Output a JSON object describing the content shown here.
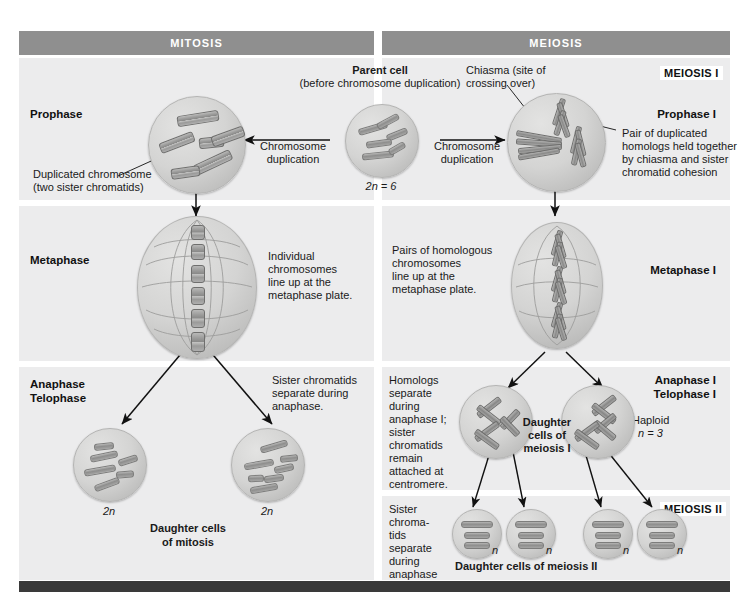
{
  "figure": {
    "title_bars": {
      "mitosis": "MITOSIS",
      "meiosis": "MEIOSIS"
    },
    "section_tags": {
      "meiosis_i": "MEIOSIS I",
      "meiosis_ii": "MEIOSIS II"
    },
    "mitosis_column": {
      "phase_labels": {
        "prophase": "Prophase",
        "metaphase": "Metaphase",
        "anaphase": "Anaphase",
        "telophase": "Telophase"
      },
      "annotations": {
        "duplicated_chromosome_line1": "Duplicated chromosome",
        "duplicated_chromosome_line2": "(two sister chromatids)",
        "chromosome_duplication": "Chromosome\nduplication",
        "individual_chromosomes": "Individual\nchromosomes\nline up at the\nmetaphase plate.",
        "sister_chromatids_separate": "Sister chromatids\nseparate during\nanaphase."
      },
      "ploidy_left": "2n",
      "ploidy_right": "2n",
      "daughter_cells_caption": "Daughter cells\nof mitosis"
    },
    "parent_cell": {
      "title": "Parent cell",
      "subtitle": "(before chromosome duplication)",
      "ploidy": "2n = 6",
      "duplication_label": "Chromosome\nduplication"
    },
    "meiosis_column": {
      "phase_labels": {
        "prophase_i": "Prophase I",
        "metaphase_i": "Metaphase I",
        "anaphase_i": "Anaphase I",
        "telophase_i": "Telophase I"
      },
      "annotations": {
        "chiasma": "Chiasma (site of\ncrossing over)",
        "pair_of_homologs": "Pair of duplicated\nhomologs held together\nby chiasma and sister\nchromatid cohesion",
        "pairs_of_homologous": "Pairs of homologous\nchromosomes\nline up at the\nmetaphase plate.",
        "homologs_separate": "Homologs\nseparate\nduring\nanaphase I;\nsister\nchromatids\nremain\nattached at\ncentromere.",
        "haploid": "Haploid",
        "haploid_n": "n = 3",
        "daughter_cells_meiosis_i": "Daughter\ncells of\nmeiosis I",
        "sister_chromatids_separate_ii": "Sister\nchroma-\ntids\nseparate\nduring\nanaphase II.",
        "daughter_cells_meiosis_ii": "Daughter cells of meiosis II"
      },
      "ploidy_meiosis_ii": [
        "n",
        "n",
        "n",
        "n"
      ]
    },
    "colors": {
      "header_bar": "#8f8f8f",
      "panel_bg": "#ececed",
      "bottom_bar": "#3a3a3a",
      "chromosome": "#8e8e8d",
      "text": "#1a1a1a"
    }
  }
}
